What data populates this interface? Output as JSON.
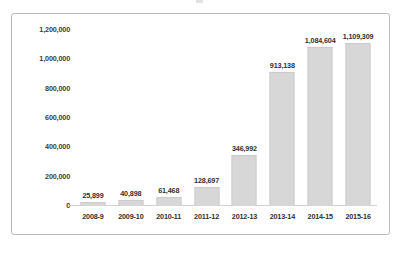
{
  "figure": {
    "background_color": "#ffffff",
    "frame_border_color": "#b9b9b9",
    "bar_color": "#d7d7d7",
    "axis_line_color": "#d2d2d2",
    "label_color": "#2f2f2f"
  },
  "chart_data": {
    "type": "bar",
    "title": "",
    "subtitle": "",
    "xlabel": "",
    "ylabel": "",
    "categories": [
      "2008-9",
      "2009-10",
      "2010-11",
      "2011-12",
      "2012-13",
      "2013-14",
      "2014-15",
      "2015-16"
    ],
    "values": [
      25899,
      40898,
      61468,
      128697,
      346992,
      913138,
      1084604,
      1109309
    ],
    "data_labels": [
      "25,899",
      "40,898",
      "61,468",
      "128,697",
      "346,992",
      "913,138",
      "1,084,604",
      "1,109,309"
    ],
    "ylim": [
      0,
      1200000
    ],
    "ytick_values": [
      0,
      200000,
      400000,
      600000,
      800000,
      1000000,
      1200000
    ],
    "ytick_labels": [
      "0",
      "200,000",
      "400,000",
      "600,000",
      "800,000",
      "1,000,000",
      "1,200,000"
    ],
    "grid": false,
    "legend": false,
    "legend_position": "none",
    "series": [
      {
        "name": "",
        "values": [
          25899,
          40898,
          61468,
          128697,
          346992,
          913138,
          1084604,
          1109309
        ]
      }
    ]
  }
}
